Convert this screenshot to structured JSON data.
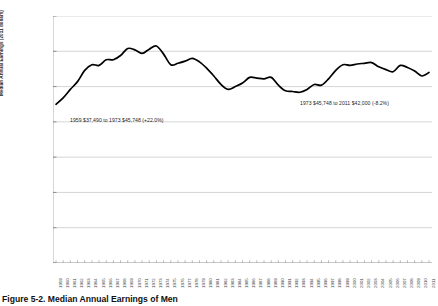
{
  "figure": {
    "caption": "Figure 5-2.  Median Annual Earnings of Men"
  },
  "chart_data": {
    "type": "line",
    "title": "",
    "xlabel": "",
    "ylabel": "Median Annual Earnings (2011 dollars)",
    "ylim": [
      15000,
      50000
    ],
    "ytick_labels": [
      "$50,000",
      "$45,000",
      "$40,000",
      "$35,000",
      "$30,000",
      "$25,000",
      "$20,000",
      "$15,000"
    ],
    "ytick_values": [
      50000,
      45000,
      40000,
      35000,
      30000,
      25000,
      20000,
      15000
    ],
    "grid": true,
    "legend": "none",
    "line_color": "#000000",
    "x": [
      1959,
      1960,
      1961,
      1962,
      1963,
      1964,
      1965,
      1966,
      1967,
      1968,
      1969,
      1970,
      1971,
      1972,
      1973,
      1974,
      1975,
      1976,
      1977,
      1978,
      1979,
      1980,
      1981,
      1982,
      1983,
      1984,
      1985,
      1986,
      1987,
      1988,
      1989,
      1990,
      1991,
      1992,
      1993,
      1994,
      1995,
      1996,
      1997,
      1998,
      1999,
      2000,
      2001,
      2002,
      2003,
      2004,
      2005,
      2006,
      2007,
      2008,
      2009,
      2010,
      2011
    ],
    "categories": [
      "1959",
      "1960",
      "1961",
      "1962",
      "1963",
      "1964",
      "1965",
      "1966",
      "1967",
      "1968",
      "1969",
      "1970",
      "1971",
      "1972",
      "1973",
      "1974",
      "1975",
      "1976",
      "1977",
      "1978",
      "1979",
      "1980",
      "1981",
      "1982",
      "1983",
      "1984",
      "1985",
      "1986",
      "1987",
      "1988",
      "1989",
      "1990",
      "1991",
      "1992",
      "1993",
      "1994",
      "1995",
      "1996",
      "1997",
      "1998",
      "1999",
      "2000",
      "2001",
      "2002",
      "2003",
      "2004",
      "2005",
      "2006",
      "2007",
      "2008",
      "2009",
      "2010",
      "2011"
    ],
    "values": [
      37490,
      38400,
      39600,
      40700,
      42300,
      43100,
      43000,
      43800,
      43800,
      44400,
      45400,
      45200,
      44700,
      45300,
      45748,
      44600,
      43100,
      43300,
      43600,
      44000,
      43500,
      42600,
      41500,
      40300,
      39600,
      40000,
      40500,
      41300,
      41200,
      41100,
      41300,
      40200,
      39400,
      39300,
      39200,
      39600,
      40300,
      40200,
      41100,
      42300,
      43100,
      43000,
      43200,
      43300,
      43400,
      42800,
      42400,
      42100,
      43000,
      42700,
      42200,
      41500,
      42000
    ],
    "annotations": [
      {
        "text": "1959 $37,490 to 1973 $45,748 (+22.0%)",
        "start_year": 1959,
        "start_value": 37490,
        "end_year": 1973,
        "end_value": 45748,
        "change_pct": "+22.0%"
      },
      {
        "text": "1973 $45,748 to 2011 $42,000 (-8.2%)",
        "start_year": 1973,
        "start_value": 45748,
        "end_year": 2011,
        "end_value": 42000,
        "change_pct": "-8.2%"
      }
    ]
  }
}
